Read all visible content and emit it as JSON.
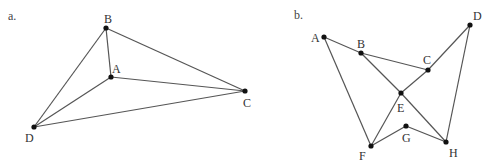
{
  "panels": [
    {
      "label": "a.",
      "label_pos": [
        8,
        20
      ],
      "points": {
        "A": {
          "x": 111,
          "y": 77,
          "lx": 112,
          "ly": 73
        },
        "B": {
          "x": 106,
          "y": 28,
          "lx": 104,
          "ly": 23
        },
        "C": {
          "x": 245,
          "y": 91,
          "lx": 243,
          "ly": 107
        },
        "D": {
          "x": 34,
          "y": 127,
          "lx": 25,
          "ly": 142
        }
      },
      "edges": [
        [
          "B",
          "D"
        ],
        [
          "B",
          "A"
        ],
        [
          "B",
          "C"
        ],
        [
          "A",
          "D"
        ],
        [
          "A",
          "C"
        ],
        [
          "D",
          "C"
        ]
      ]
    },
    {
      "label": "b.",
      "label_pos": [
        294,
        19
      ],
      "points": {
        "A": {
          "x": 324,
          "y": 37,
          "lx": 311,
          "ly": 42
        },
        "B": {
          "x": 361,
          "y": 53,
          "lx": 357,
          "ly": 48
        },
        "C": {
          "x": 428,
          "y": 70,
          "lx": 423,
          "ly": 64
        },
        "D": {
          "x": 470,
          "y": 25,
          "lx": 473,
          "ly": 20
        },
        "E": {
          "x": 401,
          "y": 93,
          "lx": 397,
          "ly": 112
        },
        "F": {
          "x": 371,
          "y": 146,
          "lx": 359,
          "ly": 160
        },
        "G": {
          "x": 406,
          "y": 126,
          "lx": 402,
          "ly": 142
        },
        "H": {
          "x": 446,
          "y": 142,
          "lx": 449,
          "ly": 157
        }
      },
      "edges": [
        [
          "A",
          "B"
        ],
        [
          "B",
          "C"
        ],
        [
          "A",
          "F"
        ],
        [
          "B",
          "E"
        ],
        [
          "E",
          "H"
        ],
        [
          "C",
          "E"
        ],
        [
          "E",
          "F"
        ],
        [
          "C",
          "D"
        ],
        [
          "D",
          "H"
        ],
        [
          "F",
          "G"
        ],
        [
          "G",
          "H"
        ]
      ]
    }
  ]
}
